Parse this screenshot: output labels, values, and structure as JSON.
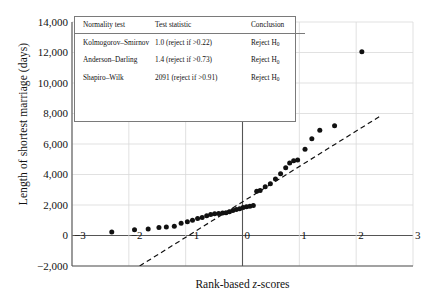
{
  "chart_data": {
    "type": "scatter",
    "title": "",
    "xlabel": "Rank-based z-scores",
    "ylabel": "Length of shortest marriage (days)",
    "xlim": [
      -3,
      3
    ],
    "ylim": [
      -2000,
      14000
    ],
    "xticks": [
      -3,
      -2,
      -1,
      0,
      1,
      2,
      3
    ],
    "xticklabels": [
      "−3",
      "−2",
      "−1",
      "0",
      "1",
      "2",
      "3"
    ],
    "yticks": [
      -2000,
      0,
      2000,
      4000,
      6000,
      8000,
      10000,
      12000,
      14000
    ],
    "yticklabels": [
      "−2,000",
      "0",
      "2,000",
      "4,000",
      "6,000",
      "8,000",
      "10,000",
      "12,000",
      "14,000"
    ],
    "grid": true,
    "legend": "none",
    "series": [
      {
        "name": "Shortest marriage length vs rank-based z-score",
        "marker": "filled-circle",
        "color": "#111111",
        "points": [
          [
            -2.3,
            230
          ],
          [
            -1.9,
            380
          ],
          [
            -1.66,
            420
          ],
          [
            -1.47,
            520
          ],
          [
            -1.34,
            560
          ],
          [
            -1.2,
            600
          ],
          [
            -1.08,
            800
          ],
          [
            -0.97,
            900
          ],
          [
            -0.88,
            1000
          ],
          [
            -0.79,
            1120
          ],
          [
            -0.71,
            1180
          ],
          [
            -0.63,
            1300
          ],
          [
            -0.56,
            1380
          ],
          [
            -0.49,
            1420
          ],
          [
            -0.42,
            1450
          ],
          [
            -0.35,
            1480
          ],
          [
            -0.29,
            1500
          ],
          [
            -0.23,
            1560
          ],
          [
            -0.17,
            1640
          ],
          [
            -0.11,
            1700
          ],
          [
            -0.05,
            1760
          ],
          [
            0.01,
            1830
          ],
          [
            0.07,
            1880
          ],
          [
            0.13,
            1920
          ],
          [
            0.19,
            1960
          ],
          [
            0.25,
            2900
          ],
          [
            0.31,
            2950
          ],
          [
            0.4,
            3200
          ],
          [
            0.49,
            3400
          ],
          [
            0.58,
            3700
          ],
          [
            0.67,
            4050
          ],
          [
            0.76,
            4450
          ],
          [
            0.83,
            4750
          ],
          [
            0.9,
            4900
          ],
          [
            0.97,
            4950
          ],
          [
            1.1,
            5650
          ],
          [
            1.22,
            6350
          ],
          [
            1.36,
            6900
          ],
          [
            1.62,
            7200
          ],
          [
            2.1,
            12050
          ]
        ]
      }
    ],
    "reference_line": {
      "name": "normal reference line",
      "style": "dashed",
      "color": "#111111",
      "x_start": -1.81,
      "y_start": -2000,
      "x_end": 2.41,
      "y_end": 7800
    }
  },
  "table": {
    "name": "normality-test-results",
    "headers": [
      "Normality test",
      "Test statistic",
      "Conclusion"
    ],
    "rows": [
      {
        "test": "Kolmogorov–Smirnov",
        "statistic": "1.0 (reject if >0.22)",
        "conclusion_prefix": "Reject H",
        "conclusion_sub": "0"
      },
      {
        "test": "Anderson–Darling",
        "statistic": "1.4 (reject if >0.73)",
        "conclusion_prefix": "Reject H",
        "conclusion_sub": "0"
      },
      {
        "test": "Shapiro–Wilk",
        "statistic": "2091 (reject if >0.91)",
        "conclusion_prefix": "Reject H",
        "conclusion_sub": "0"
      }
    ]
  },
  "axis_label_parts": {
    "x_pre": "Rank-based ",
    "x_italic": "z",
    "x_post": "-scores"
  }
}
